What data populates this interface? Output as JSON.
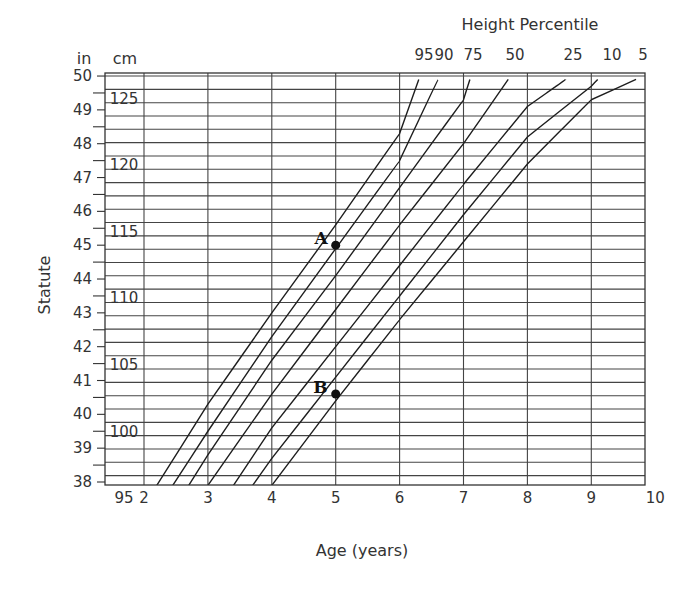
{
  "chart_data": {
    "type": "line",
    "title": "Height Percentile",
    "xlabel": "Age (years)",
    "ylabel": "Statute",
    "y_units": [
      "in",
      "cm"
    ],
    "xlim": [
      1.4,
      10
    ],
    "x_ticks": [
      2,
      3,
      4,
      5,
      6,
      7,
      8,
      9,
      10
    ],
    "y_in_ticks": [
      38,
      39,
      40,
      41,
      42,
      43,
      44,
      45,
      46,
      47,
      48,
      49,
      50
    ],
    "y_cm_labels": [
      95,
      100,
      105,
      110,
      115,
      120,
      125
    ],
    "ylim_in": [
      37.9,
      50.1
    ],
    "grid": true,
    "percentile_labels": [
      "95",
      "90",
      "75",
      "50",
      "25",
      "10",
      "5"
    ],
    "series": [
      {
        "name": "95",
        "points": [
          [
            2.2,
            37.9
          ],
          [
            3.0,
            40.3
          ],
          [
            4.0,
            43.0
          ],
          [
            5.0,
            45.6
          ],
          [
            6.0,
            48.3
          ],
          [
            6.3,
            49.9
          ]
        ]
      },
      {
        "name": "90",
        "points": [
          [
            2.45,
            37.9
          ],
          [
            3.0,
            39.5
          ],
          [
            4.0,
            42.3
          ],
          [
            5.0,
            44.9
          ],
          [
            6.0,
            47.5
          ],
          [
            6.6,
            49.9
          ]
        ]
      },
      {
        "name": "75",
        "points": [
          [
            2.7,
            37.9
          ],
          [
            3.0,
            38.8
          ],
          [
            4.0,
            41.6
          ],
          [
            5.0,
            44.1
          ],
          [
            6.0,
            46.7
          ],
          [
            7.0,
            49.3
          ],
          [
            7.1,
            49.9
          ]
        ]
      },
      {
        "name": "50",
        "points": [
          [
            3.0,
            37.9
          ],
          [
            4.0,
            40.6
          ],
          [
            5.0,
            43.1
          ],
          [
            6.0,
            45.6
          ],
          [
            7.0,
            48.0
          ],
          [
            7.7,
            49.9
          ]
        ]
      },
      {
        "name": "25",
        "points": [
          [
            3.4,
            37.9
          ],
          [
            4.0,
            39.6
          ],
          [
            5.0,
            42.0
          ],
          [
            6.0,
            44.4
          ],
          [
            7.0,
            46.8
          ],
          [
            8.0,
            49.1
          ],
          [
            8.6,
            49.9
          ]
        ]
      },
      {
        "name": "10",
        "points": [
          [
            3.7,
            37.9
          ],
          [
            4.0,
            38.7
          ],
          [
            5.0,
            41.1
          ],
          [
            6.0,
            43.5
          ],
          [
            7.0,
            45.9
          ],
          [
            8.0,
            48.2
          ],
          [
            9.0,
            49.7
          ],
          [
            9.1,
            49.9
          ]
        ]
      },
      {
        "name": "5",
        "points": [
          [
            4.0,
            37.9
          ],
          [
            5.0,
            40.4
          ],
          [
            6.0,
            42.8
          ],
          [
            7.0,
            45.1
          ],
          [
            8.0,
            47.4
          ],
          [
            9.0,
            49.3
          ],
          [
            9.7,
            49.9
          ]
        ]
      }
    ],
    "annotations": [
      {
        "label": "A",
        "x": 5,
        "y_in": 45.0
      },
      {
        "label": "B",
        "x": 5,
        "y_in": 40.6
      }
    ]
  }
}
